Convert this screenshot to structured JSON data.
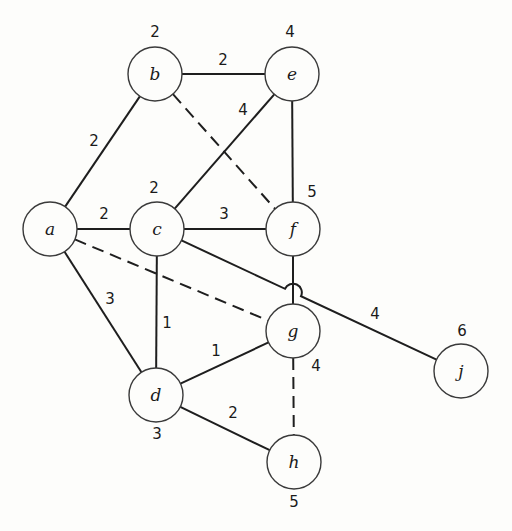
{
  "diagram": {
    "type": "weighted-graph",
    "style": {
      "line_color": "#1e1e1e",
      "node_stroke": "#3a3a3a",
      "background": "#fdfdfb"
    },
    "node_radius": 27,
    "nodes": [
      {
        "id": "a",
        "label": "a",
        "x": 50,
        "y": 229,
        "value": null,
        "vx": null,
        "vy": null
      },
      {
        "id": "b",
        "label": "b",
        "x": 155,
        "y": 74,
        "value": "2",
        "vx": 155,
        "vy": 32
      },
      {
        "id": "c",
        "label": "c",
        "x": 157,
        "y": 229,
        "value": "2",
        "vx": 154,
        "vy": 188
      },
      {
        "id": "e",
        "label": "e",
        "x": 292,
        "y": 74,
        "value": "4",
        "vx": 290,
        "vy": 32
      },
      {
        "id": "f",
        "label": "f",
        "x": 293,
        "y": 229,
        "value": "5",
        "vx": 312,
        "vy": 192
      },
      {
        "id": "g",
        "label": "g",
        "x": 293,
        "y": 331,
        "value": "4",
        "vx": 316,
        "vy": 366
      },
      {
        "id": "d",
        "label": "d",
        "x": 156,
        "y": 395,
        "value": "3",
        "vx": 157,
        "vy": 434
      },
      {
        "id": "h",
        "label": "h",
        "x": 294,
        "y": 462,
        "value": "5",
        "vx": 294,
        "vy": 502
      },
      {
        "id": "j",
        "label": "j",
        "x": 461,
        "y": 371,
        "value": "6",
        "vx": 462,
        "vy": 331
      }
    ],
    "edges": [
      {
        "from": "a",
        "to": "b",
        "weight": "2",
        "dashed": false,
        "lx": 94,
        "ly": 141
      },
      {
        "from": "b",
        "to": "e",
        "weight": "2",
        "dashed": false,
        "lx": 223,
        "ly": 60
      },
      {
        "from": "c",
        "to": "e",
        "weight": "4",
        "dashed": false,
        "lx": 243,
        "ly": 110
      },
      {
        "from": "a",
        "to": "c",
        "weight": "2",
        "dashed": false,
        "lx": 104,
        "ly": 214
      },
      {
        "from": "c",
        "to": "f",
        "weight": "3",
        "dashed": false,
        "lx": 224,
        "ly": 214
      },
      {
        "from": "a",
        "to": "d",
        "weight": "3",
        "dashed": false,
        "lx": 110,
        "ly": 299
      },
      {
        "from": "c",
        "to": "d",
        "weight": "1",
        "dashed": false,
        "lx": 167,
        "ly": 323
      },
      {
        "from": "d",
        "to": "g",
        "weight": "1",
        "dashed": false,
        "lx": 216,
        "ly": 351
      },
      {
        "from": "d",
        "to": "h",
        "weight": "2",
        "dashed": false,
        "lx": 233,
        "ly": 413
      },
      {
        "from": "e",
        "to": "f",
        "weight": "",
        "dashed": false,
        "lx": null,
        "ly": null
      },
      {
        "from": "f",
        "to": "g",
        "weight": "",
        "dashed": false,
        "lx": null,
        "ly": null
      },
      {
        "from": "c",
        "to": "j",
        "weight": "4",
        "dashed": false,
        "lx": 375,
        "ly": 314,
        "hop_over": "f-g"
      },
      {
        "from": "b",
        "to": "f",
        "weight": "",
        "dashed": true,
        "lx": null,
        "ly": null
      },
      {
        "from": "a",
        "to": "g",
        "weight": "",
        "dashed": true,
        "lx": null,
        "ly": null
      },
      {
        "from": "g",
        "to": "h",
        "weight": "",
        "dashed": true,
        "lx": null,
        "ly": null
      }
    ]
  }
}
